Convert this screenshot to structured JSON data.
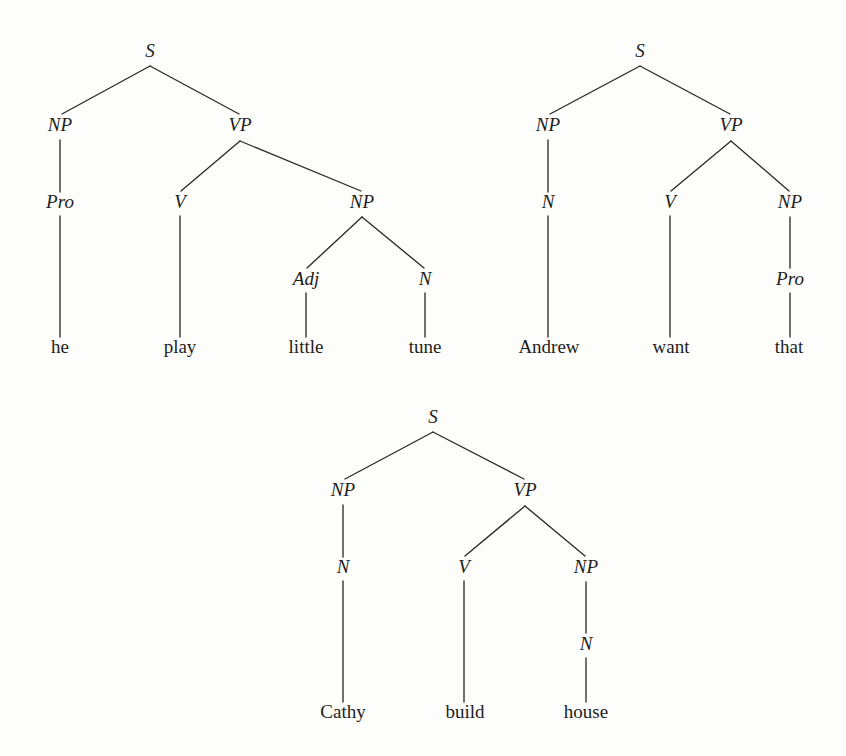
{
  "page": {
    "width": 846,
    "height": 756,
    "background_color": "#fdfdfc",
    "ink_color": "#1d1d1d",
    "line_color": "#2b2b2b"
  },
  "chart_data": {
    "type": "diagram",
    "diagram_kind": "constituency-syntax-trees",
    "title": "",
    "trees": [
      {
        "id": "tree-1",
        "sentence": "he play little tune",
        "root": "S",
        "rules": [
          "S -> NP VP",
          "NP -> Pro",
          "Pro -> he",
          "VP -> V NP",
          "V -> play",
          "NP -> Adj N",
          "Adj -> little",
          "N -> tune"
        ],
        "nodes": [
          {
            "id": "t1-s",
            "label": "S",
            "kind": "node",
            "x": 150,
            "y": 57
          },
          {
            "id": "t1-np1",
            "label": "NP",
            "kind": "node",
            "x": 60,
            "y": 131
          },
          {
            "id": "t1-vp",
            "label": "VP",
            "kind": "node",
            "x": 240,
            "y": 131
          },
          {
            "id": "t1-pro",
            "label": "Pro",
            "kind": "node",
            "x": 60,
            "y": 208
          },
          {
            "id": "t1-v",
            "label": "V",
            "kind": "node",
            "x": 180,
            "y": 208
          },
          {
            "id": "t1-np2",
            "label": "NP",
            "kind": "node",
            "x": 362,
            "y": 208
          },
          {
            "id": "t1-adj",
            "label": "Adj",
            "kind": "node",
            "x": 306,
            "y": 285
          },
          {
            "id": "t1-n",
            "label": "N",
            "kind": "node",
            "x": 425,
            "y": 285
          },
          {
            "id": "t1-he",
            "label": "he",
            "kind": "leaf",
            "x": 60,
            "y": 353
          },
          {
            "id": "t1-play",
            "label": "play",
            "kind": "leaf",
            "x": 180,
            "y": 353
          },
          {
            "id": "t1-lit",
            "label": "little",
            "kind": "leaf",
            "x": 306,
            "y": 353
          },
          {
            "id": "t1-tune",
            "label": "tune",
            "kind": "leaf",
            "x": 425,
            "y": 353
          }
        ],
        "edges": [
          {
            "x1": 150,
            "y1": 66,
            "x2": 62,
            "y2": 114
          },
          {
            "x1": 150,
            "y1": 66,
            "x2": 239,
            "y2": 114
          },
          {
            "x1": 60,
            "y1": 140,
            "x2": 60,
            "y2": 192
          },
          {
            "x1": 240,
            "y1": 141,
            "x2": 181,
            "y2": 191
          },
          {
            "x1": 240,
            "y1": 141,
            "x2": 361,
            "y2": 191
          },
          {
            "x1": 60,
            "y1": 216,
            "x2": 60,
            "y2": 337
          },
          {
            "x1": 180,
            "y1": 216,
            "x2": 180,
            "y2": 337
          },
          {
            "x1": 362,
            "y1": 217,
            "x2": 307,
            "y2": 268
          },
          {
            "x1": 362,
            "y1": 217,
            "x2": 424,
            "y2": 268
          },
          {
            "x1": 306,
            "y1": 293,
            "x2": 306,
            "y2": 337
          },
          {
            "x1": 425,
            "y1": 293,
            "x2": 425,
            "y2": 337
          }
        ]
      },
      {
        "id": "tree-2",
        "sentence": "Andrew want that",
        "root": "S",
        "rules": [
          "S -> NP VP",
          "NP -> N",
          "N -> Andrew",
          "VP -> V NP",
          "V -> want",
          "NP -> Pro",
          "Pro -> that"
        ],
        "nodes": [
          {
            "id": "t2-s",
            "label": "S",
            "kind": "node",
            "x": 640,
            "y": 57
          },
          {
            "id": "t2-np1",
            "label": "NP",
            "kind": "node",
            "x": 548,
            "y": 131
          },
          {
            "id": "t2-vp",
            "label": "VP",
            "kind": "node",
            "x": 731,
            "y": 131
          },
          {
            "id": "t2-n",
            "label": "N",
            "kind": "node",
            "x": 548,
            "y": 208
          },
          {
            "id": "t2-v",
            "label": "V",
            "kind": "node",
            "x": 670,
            "y": 208
          },
          {
            "id": "t2-np2",
            "label": "NP",
            "kind": "node",
            "x": 790,
            "y": 208
          },
          {
            "id": "t2-pro",
            "label": "Pro",
            "kind": "node",
            "x": 790,
            "y": 285
          },
          {
            "id": "t2-andr",
            "label": "Andrew",
            "kind": "leaf",
            "x": 549,
            "y": 353
          },
          {
            "id": "t2-want",
            "label": "want",
            "kind": "leaf",
            "x": 671,
            "y": 353
          },
          {
            "id": "t2-that",
            "label": "that",
            "kind": "leaf",
            "x": 789,
            "y": 353
          }
        ],
        "edges": [
          {
            "x1": 640,
            "y1": 66,
            "x2": 550,
            "y2": 114
          },
          {
            "x1": 640,
            "y1": 66,
            "x2": 730,
            "y2": 114
          },
          {
            "x1": 548,
            "y1": 140,
            "x2": 548,
            "y2": 192
          },
          {
            "x1": 731,
            "y1": 141,
            "x2": 671,
            "y2": 191
          },
          {
            "x1": 731,
            "y1": 141,
            "x2": 789,
            "y2": 191
          },
          {
            "x1": 548,
            "y1": 216,
            "x2": 548,
            "y2": 337
          },
          {
            "x1": 670,
            "y1": 216,
            "x2": 670,
            "y2": 337
          },
          {
            "x1": 790,
            "y1": 217,
            "x2": 790,
            "y2": 268
          },
          {
            "x1": 790,
            "y1": 293,
            "x2": 790,
            "y2": 337
          }
        ]
      },
      {
        "id": "tree-3",
        "sentence": "Cathy build house",
        "root": "S",
        "rules": [
          "S -> NP VP",
          "NP -> N",
          "N -> Cathy",
          "VP -> V NP",
          "V -> build",
          "NP -> N",
          "N -> house"
        ],
        "nodes": [
          {
            "id": "t3-s",
            "label": "S",
            "kind": "node",
            "x": 433,
            "y": 423
          },
          {
            "id": "t3-np1",
            "label": "NP",
            "kind": "node",
            "x": 343,
            "y": 496
          },
          {
            "id": "t3-vp",
            "label": "VP",
            "kind": "node",
            "x": 525,
            "y": 496
          },
          {
            "id": "t3-n1",
            "label": "N",
            "kind": "node",
            "x": 343,
            "y": 573
          },
          {
            "id": "t3-v",
            "label": "V",
            "kind": "node",
            "x": 464,
            "y": 573
          },
          {
            "id": "t3-np2",
            "label": "NP",
            "kind": "node",
            "x": 586,
            "y": 573
          },
          {
            "id": "t3-n2",
            "label": "N",
            "kind": "node",
            "x": 586,
            "y": 650
          },
          {
            "id": "t3-cat",
            "label": "Cathy",
            "kind": "leaf",
            "x": 343,
            "y": 718
          },
          {
            "id": "t3-bui",
            "label": "build",
            "kind": "leaf",
            "x": 465,
            "y": 718
          },
          {
            "id": "t3-hou",
            "label": "house",
            "kind": "leaf",
            "x": 586,
            "y": 718
          }
        ],
        "edges": [
          {
            "x1": 433,
            "y1": 432,
            "x2": 345,
            "y2": 479
          },
          {
            "x1": 433,
            "y1": 432,
            "x2": 524,
            "y2": 479
          },
          {
            "x1": 343,
            "y1": 505,
            "x2": 343,
            "y2": 557
          },
          {
            "x1": 525,
            "y1": 506,
            "x2": 465,
            "y2": 556
          },
          {
            "x1": 525,
            "y1": 506,
            "x2": 585,
            "y2": 556
          },
          {
            "x1": 343,
            "y1": 581,
            "x2": 343,
            "y2": 702
          },
          {
            "x1": 464,
            "y1": 581,
            "x2": 464,
            "y2": 702
          },
          {
            "x1": 586,
            "y1": 582,
            "x2": 586,
            "y2": 633
          },
          {
            "x1": 586,
            "y1": 658,
            "x2": 586,
            "y2": 702
          }
        ]
      }
    ]
  }
}
